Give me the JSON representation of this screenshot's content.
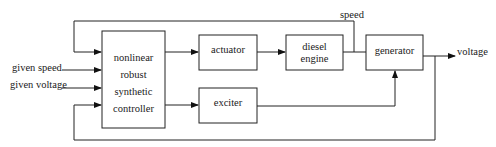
{
  "diagram": {
    "type": "block-diagram",
    "blocks": {
      "controller": {
        "lines": [
          "nonlinear",
          "robust",
          "synthetic",
          "controller"
        ]
      },
      "actuator": {
        "label": "actuator"
      },
      "diesel_engine": {
        "lines": [
          "diesel",
          "engine"
        ]
      },
      "exciter": {
        "label": "exciter"
      },
      "generator": {
        "label": "generator"
      }
    },
    "inputs": {
      "given_speed": "given speed",
      "given_voltage": "given voltage"
    },
    "signals": {
      "speed": "speed",
      "voltage": "voltage"
    },
    "edges": [
      {
        "from": "given speed",
        "to": "controller"
      },
      {
        "from": "given voltage",
        "to": "controller"
      },
      {
        "from": "controller",
        "to": "actuator"
      },
      {
        "from": "controller",
        "to": "exciter"
      },
      {
        "from": "actuator",
        "to": "diesel engine"
      },
      {
        "from": "diesel engine",
        "to": "generator"
      },
      {
        "from": "exciter",
        "to": "generator"
      },
      {
        "from": "diesel engine output (speed)",
        "to": "controller",
        "type": "feedback"
      },
      {
        "from": "generator",
        "to": "voltage"
      },
      {
        "from": "voltage",
        "to": "controller",
        "type": "feedback"
      }
    ],
    "colors": {
      "line": "#222222",
      "background": "#ffffff"
    }
  }
}
